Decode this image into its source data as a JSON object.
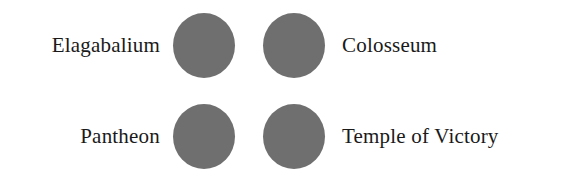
{
  "figure": {
    "background_color": "#ffffff",
    "marker_color": "#6f6f6f",
    "text_color": "#1a1a1a",
    "rows": [
      {
        "left_label": "Elagabalium",
        "right_label": "Colosseum",
        "markers": [
          "filled-circle",
          "filled-circle"
        ]
      },
      {
        "left_label": "Pantheon",
        "right_label": "Temple of Victory",
        "markers": [
          "filled-circle",
          "filled-circle"
        ]
      }
    ]
  }
}
